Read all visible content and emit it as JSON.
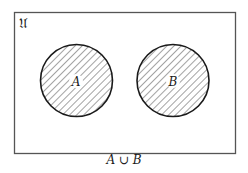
{
  "diagram": {
    "type": "venn",
    "universe_label": "𝔘",
    "sets": [
      {
        "name": "A",
        "label": "A",
        "shaded": true
      },
      {
        "name": "B",
        "label": "B",
        "shaded": true
      }
    ],
    "relationship": "disjoint",
    "caption": {
      "left": "A",
      "operator": "∪",
      "right": "B"
    },
    "colors": {
      "stroke": "#1a1a1a",
      "hatch": "#555555",
      "background": "#ffffff"
    }
  }
}
